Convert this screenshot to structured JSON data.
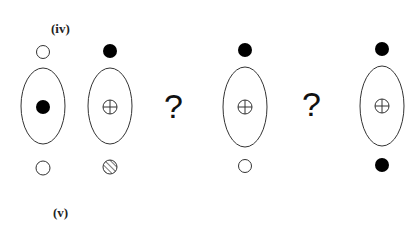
{
  "labels": {
    "top": "(iv)",
    "bottom": "(v)"
  },
  "colors": {
    "stroke": "#333333",
    "fill_dark": "#000000",
    "background": "#ffffff"
  },
  "columns": [
    {
      "id": "col1",
      "cx": 43,
      "top_marker": "open-circle",
      "center_marker": "filled-dot",
      "bottom_marker": "open-circle"
    },
    {
      "id": "col2",
      "cx": 110,
      "top_marker": "filled-circle",
      "center_marker": "circle-plus",
      "bottom_marker": "hatched-circle"
    },
    {
      "id": "col3",
      "cx": 245,
      "top_marker": "filled-circle",
      "center_marker": "circle-plus",
      "bottom_marker": "open-circle"
    },
    {
      "id": "col4",
      "cx": 382,
      "top_marker": "filled-circle",
      "center_marker": "circle-plus",
      "bottom_marker": "filled-circle"
    }
  ],
  "question_marks": [
    {
      "id": "q1",
      "text": "?",
      "x": 175
    },
    {
      "id": "q2",
      "text": "?",
      "x": 313
    }
  ]
}
